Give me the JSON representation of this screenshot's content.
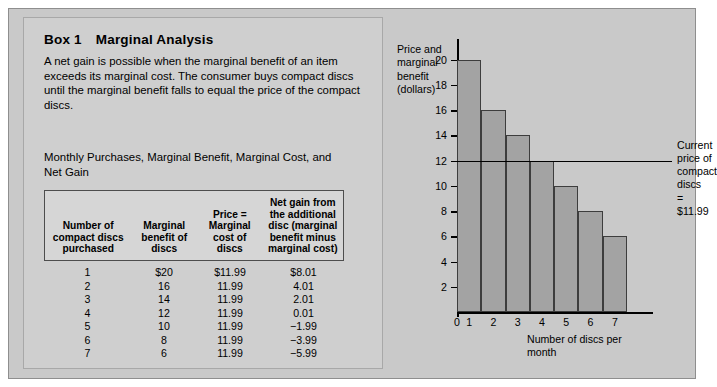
{
  "box": {
    "number": "Box 1",
    "title": "Marginal Analysis",
    "body": "A net gain is possible when the marginal benefit of an item exceeds its marginal cost. The consumer buys compact discs until the marginal benefit falls to equal the price of the compact discs."
  },
  "table": {
    "caption": "Monthly Purchases, Marginal Benefit, Marginal Cost, and Net Gain",
    "headers": [
      "Number of compact discs purchased",
      "Marginal benefit of discs",
      "Price = Marginal cost of discs",
      "Net gain from the additional disc (marginal benefit minus marginal cost)"
    ],
    "rows": [
      [
        "1",
        "$20",
        "$11.99",
        "$8.01"
      ],
      [
        "2",
        "16",
        "11.99",
        "4.01"
      ],
      [
        "3",
        "14",
        "11.99",
        "2.01"
      ],
      [
        "4",
        "12",
        "11.99",
        "0.01"
      ],
      [
        "5",
        "10",
        "11.99",
        "−1.99"
      ],
      [
        "6",
        "8",
        "11.99",
        "−3.99"
      ],
      [
        "7",
        "6",
        "11.99",
        "−5.99"
      ]
    ]
  },
  "chart_data": {
    "type": "bar",
    "title": "",
    "xlabel": "Number of discs per month",
    "ylabel": "Price and marginal benefit (dollars)",
    "categories": [
      "1",
      "2",
      "3",
      "4",
      "5",
      "6",
      "7"
    ],
    "values": [
      20,
      16,
      14,
      12,
      10,
      8,
      6
    ],
    "xtick_labels": [
      "0",
      "1",
      "2",
      "3",
      "4",
      "5",
      "6",
      "7"
    ],
    "ytick_labels": [
      "2",
      "4",
      "6",
      "8",
      "10",
      "12",
      "14",
      "16",
      "18",
      "20"
    ],
    "ylim": [
      0,
      21
    ],
    "grid": false,
    "legend": "none",
    "bar_color": "#a3a3a3",
    "bar_edge_color": "#3d3d3d",
    "annotations": [
      {
        "name": "current-price-line",
        "value": 11.99,
        "label": "Current price of\ncompact discs\n= $11.99"
      }
    ]
  }
}
